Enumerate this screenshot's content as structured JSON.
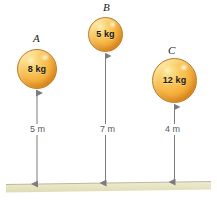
{
  "figure": {
    "background_color": "#ffffff",
    "ground": {
      "name": "ground-surface",
      "fill_color": "#e8e5c8",
      "edge_color": "#b9b694"
    },
    "bodies": [
      {
        "id": "A",
        "letter": "A",
        "mass_label": "8 kg",
        "mass_value": 8,
        "mass_unit": "kg",
        "height_label": "5 m",
        "height_value": 5,
        "height_unit": "m",
        "color": "#f5b13e"
      },
      {
        "id": "B",
        "letter": "B",
        "mass_label": "5 kg",
        "mass_value": 5,
        "mass_unit": "kg",
        "height_label": "7 m",
        "height_value": 7,
        "height_unit": "m",
        "color": "#f5b13e"
      },
      {
        "id": "C",
        "letter": "C",
        "mass_label": "12 kg",
        "mass_value": 12,
        "mass_unit": "kg",
        "height_label": "4 m",
        "height_value": 4,
        "height_unit": "m",
        "color": "#f5b13e"
      }
    ],
    "arrows": {
      "name": "height-dimension-arrow",
      "color": "#7b7b80",
      "style": "double-headed-vertical"
    }
  }
}
